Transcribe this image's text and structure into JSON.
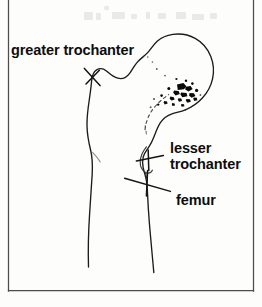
{
  "figure": {
    "name": "proximal-femur-line-drawing",
    "caption_text": "",
    "background_color": "#fdfdfc",
    "ink_color": "#1c1c1c",
    "frame_color": "#4d4d4d"
  },
  "labels": {
    "greater_trochanter": "greater trochanter",
    "lesser_trochanter_line1": "lesser",
    "lesser_trochanter_line2": "trochanter",
    "femur": "femur"
  },
  "ghost_text": {
    "visible_artifact": "",
    "description": "faint illegible scan bleed-through"
  },
  "annotations": {
    "lesion_label": "",
    "lesion_description": "stippled black speckled region in femoral neck"
  }
}
